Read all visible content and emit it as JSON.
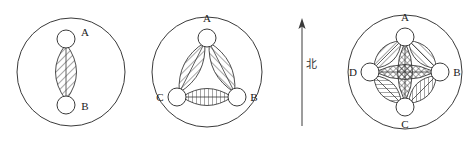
{
  "figure": {
    "title": "",
    "background_color": "#ffffff",
    "line_color": "#3a3a3a",
    "width": 473,
    "height": 143
  },
  "compass": {
    "label": "北",
    "direction": "north",
    "arrow_icon": "north-arrow-icon"
  },
  "panels": [
    {
      "id": "panel-1",
      "name": "two-node-diagram",
      "node_count": 2,
      "outer_circle": {
        "cx": 71,
        "cy": 72,
        "r": 54
      },
      "nodes": [
        {
          "id": "A",
          "label": "A",
          "cx": 66,
          "cy": 39,
          "r": 9,
          "label_x": 85,
          "label_y": 36
        },
        {
          "id": "B",
          "label": "B",
          "cx": 66,
          "cy": 105,
          "r": 9,
          "label_x": 85,
          "label_y": 110
        }
      ],
      "bonds": [
        {
          "from": "A",
          "to": "B",
          "hatch": "diagonal-right",
          "width": 21
        }
      ]
    },
    {
      "id": "panel-2",
      "name": "three-node-diagram",
      "node_count": 3,
      "outer_circle": {
        "cx": 207,
        "cy": 72,
        "r": 55
      },
      "nodes": [
        {
          "id": "A",
          "label": "A",
          "cx": 207,
          "cy": 38,
          "r": 9,
          "label_x": 207,
          "label_y": 22
        },
        {
          "id": "C",
          "label": "C",
          "cx": 177,
          "cy": 97,
          "r": 9,
          "label_x": 160,
          "label_y": 101
        },
        {
          "id": "B",
          "label": "B",
          "cx": 237,
          "cy": 97,
          "r": 9,
          "label_x": 254,
          "label_y": 101
        }
      ],
      "bonds": [
        {
          "from": "A",
          "to": "C",
          "hatch": "diagonal-right",
          "width": 17
        },
        {
          "from": "A",
          "to": "B",
          "hatch": "diagonal-left",
          "width": 17
        },
        {
          "from": "C",
          "to": "B",
          "hatch": "vertical",
          "width": 17
        }
      ]
    },
    {
      "id": "panel-3",
      "name": "four-node-diagram",
      "node_count": 4,
      "outer_circle": {
        "cx": 405,
        "cy": 72,
        "r": 57
      },
      "nodes": [
        {
          "id": "A",
          "label": "A",
          "cx": 405,
          "cy": 37,
          "r": 9,
          "label_x": 405,
          "label_y": 21
        },
        {
          "id": "B",
          "label": "B",
          "cx": 440,
          "cy": 72,
          "r": 9,
          "label_x": 457,
          "label_y": 76
        },
        {
          "id": "C",
          "label": "C",
          "cx": 405,
          "cy": 107,
          "r": 9,
          "label_x": 405,
          "label_y": 128
        },
        {
          "id": "D",
          "label": "D",
          "cx": 370,
          "cy": 72,
          "r": 9,
          "label_x": 353,
          "label_y": 76
        }
      ],
      "bonds": [
        {
          "from": "A",
          "to": "B",
          "hatch": "diagonal-left",
          "width": 16
        },
        {
          "from": "B",
          "to": "C",
          "hatch": "vertical",
          "width": 16
        },
        {
          "from": "C",
          "to": "D",
          "hatch": "horizontal",
          "width": 16
        },
        {
          "from": "D",
          "to": "A",
          "hatch": "diagonal-right",
          "width": 16
        },
        {
          "from": "A",
          "to": "C",
          "hatch": "cross",
          "width": 15
        },
        {
          "from": "D",
          "to": "B",
          "hatch": "cross",
          "width": 15
        }
      ]
    }
  ]
}
